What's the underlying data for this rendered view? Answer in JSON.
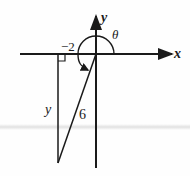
{
  "diagram": {
    "type": "trigonometry-reference-triangle",
    "axes": {
      "x_label": "x",
      "y_label": "y"
    },
    "angle_label": "θ",
    "triangle": {
      "horizontal_leg_label": "−2",
      "vertical_leg_label": "y",
      "hypotenuse_label": "6",
      "right_angle_marker": true
    },
    "colors": {
      "stroke": "#1a1a1a",
      "background": "#fefefe"
    }
  }
}
